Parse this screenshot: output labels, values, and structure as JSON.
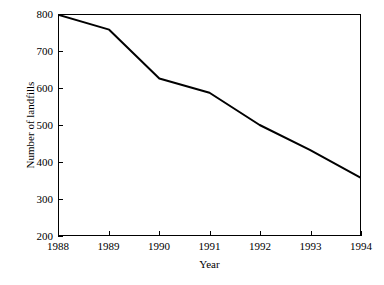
{
  "chart_data": {
    "type": "line",
    "title": "",
    "xlabel": "Year",
    "ylabel": "Number of landfills",
    "x": [
      1988,
      1989,
      1990,
      1991,
      1992,
      1993,
      1994
    ],
    "categories": [
      "1988",
      "1989",
      "1990",
      "1991",
      "1992",
      "1993",
      "1994"
    ],
    "values": [
      800,
      760,
      627,
      588,
      500,
      432,
      357
    ],
    "series": [
      {
        "name": "Number of landfills",
        "values": [
          800,
          760,
          627,
          588,
          500,
          432,
          357
        ]
      }
    ],
    "xlim": [
      1988,
      1994
    ],
    "ylim": [
      200,
      800
    ],
    "yticks": [
      200,
      300,
      400,
      500,
      600,
      700,
      800
    ],
    "ytick_labels": [
      "200",
      "300",
      "400",
      "500",
      "600",
      "700",
      "800"
    ],
    "xticks": [
      1988,
      1989,
      1990,
      1991,
      1992,
      1993,
      1994
    ],
    "xtick_labels": [
      "1988",
      "1989",
      "1990",
      "1991",
      "1992",
      "1993",
      "1994"
    ],
    "grid": false,
    "legend": false,
    "legend_position": "none",
    "markers": false,
    "line_color": "#000000",
    "line_width": 2,
    "background_color": "#ffffff",
    "axis_color": "#000000",
    "tick_direction": "in"
  }
}
